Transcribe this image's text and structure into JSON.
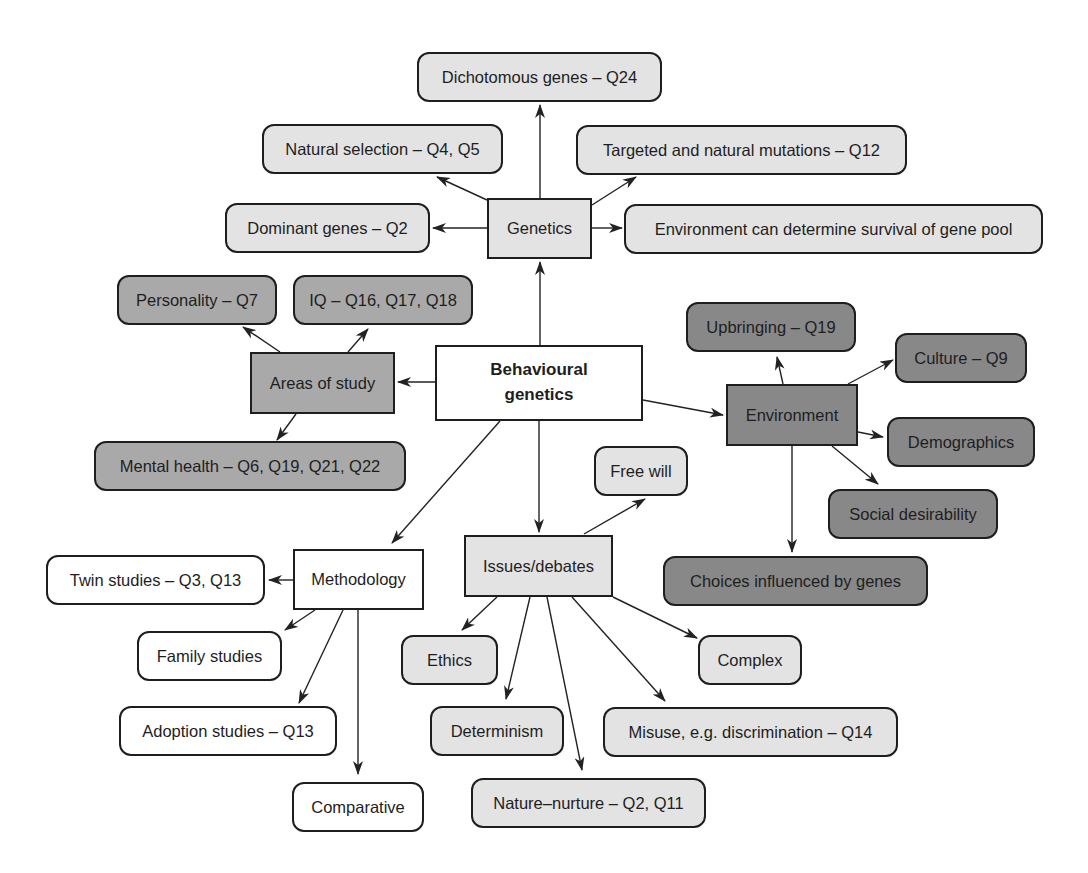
{
  "diagram": {
    "type": "concept-map",
    "colors": {
      "border": "#1e1e1e",
      "white": "#ffffff",
      "light_gray": "#e3e3e3",
      "mid_gray": "#a9a9a9",
      "dark_gray": "#888888",
      "arrow": "#222222"
    },
    "central": {
      "id": "behavioural-genetics",
      "label_line1": "Behavioural",
      "label_line2": "genetics"
    },
    "nodes": {
      "genetics": "Genetics",
      "dichotomous": "Dichotomous genes – Q24",
      "natural_selection": "Natural selection – Q4, Q5",
      "targeted_mutations": "Targeted and natural mutations – Q12",
      "dominant": "Dominant genes – Q2",
      "env_gene_pool": "Environment can determine survival of gene pool",
      "areas": "Areas of study",
      "personality": "Personality – Q7",
      "iq": "IQ – Q16, Q17, Q18",
      "mental_health": "Mental health – Q6, Q19, Q21, Q22",
      "environment": "Environment",
      "upbringing": "Upbringing – Q19",
      "culture": "Culture – Q9",
      "demographics": "Demographics",
      "social_desirability": "Social desirability",
      "choices": "Choices influenced by genes",
      "methodology": "Methodology",
      "twin": "Twin studies – Q3, Q13",
      "family": "Family studies",
      "adoption": "Adoption studies – Q13",
      "comparative": "Comparative",
      "issues": "Issues/debates",
      "free_will": "Free will",
      "ethics": "Ethics",
      "determinism": "Determinism",
      "nature_nurture": "Nature–nurture – Q2, Q11",
      "misuse": "Misuse, e.g. discrimination – Q14",
      "complex": "Complex"
    },
    "edges": [
      [
        "behavioural-genetics",
        "genetics"
      ],
      [
        "genetics",
        "dichotomous"
      ],
      [
        "genetics",
        "natural_selection"
      ],
      [
        "genetics",
        "targeted_mutations"
      ],
      [
        "genetics",
        "dominant"
      ],
      [
        "genetics",
        "env_gene_pool"
      ],
      [
        "behavioural-genetics",
        "areas"
      ],
      [
        "areas",
        "personality"
      ],
      [
        "areas",
        "iq"
      ],
      [
        "areas",
        "mental_health"
      ],
      [
        "behavioural-genetics",
        "environment"
      ],
      [
        "environment",
        "upbringing"
      ],
      [
        "environment",
        "culture"
      ],
      [
        "environment",
        "demographics"
      ],
      [
        "environment",
        "social_desirability"
      ],
      [
        "environment",
        "choices"
      ],
      [
        "behavioural-genetics",
        "methodology"
      ],
      [
        "methodology",
        "twin"
      ],
      [
        "methodology",
        "family"
      ],
      [
        "methodology",
        "adoption"
      ],
      [
        "methodology",
        "comparative"
      ],
      [
        "behavioural-genetics",
        "issues"
      ],
      [
        "issues",
        "free_will"
      ],
      [
        "issues",
        "ethics"
      ],
      [
        "issues",
        "determinism"
      ],
      [
        "issues",
        "nature_nurture"
      ],
      [
        "issues",
        "misuse"
      ],
      [
        "issues",
        "complex"
      ]
    ]
  }
}
